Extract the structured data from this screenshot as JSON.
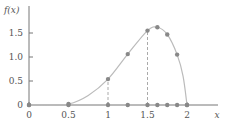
{
  "chart_data": {
    "type": "line",
    "title": "",
    "xlabel": "x",
    "ylabel": "f(x)",
    "xlim": [
      0,
      2.3
    ],
    "ylim": [
      0,
      1.75
    ],
    "x_ticks": [
      "0",
      "0.5",
      "1",
      "1.5",
      "2"
    ],
    "x_tick_values": [
      0,
      0.5,
      1,
      1.5,
      2
    ],
    "y_ticks": [
      "0",
      "0.5",
      "1.0",
      "1.5"
    ],
    "y_tick_values": [
      0,
      0.5,
      1.0,
      1.5
    ],
    "grid": false,
    "legend": null,
    "curve": {
      "x": [
        0,
        0.25,
        0.5,
        0.75,
        1.0,
        1.25,
        1.5,
        1.625,
        1.75,
        1.875,
        1.95,
        2.0
      ],
      "y": [
        0,
        0,
        0.02,
        0.2,
        0.54,
        1.06,
        1.55,
        1.62,
        1.47,
        1.05,
        0.6,
        0
      ]
    },
    "points_on_curve": {
      "x": [
        0,
        0.5,
        1.0,
        1.25,
        1.5,
        1.625,
        1.75,
        1.875,
        2.0
      ],
      "y": [
        0,
        0.02,
        0.54,
        1.06,
        1.55,
        1.62,
        1.47,
        1.05,
        0
      ]
    },
    "points_on_axis": {
      "x": [
        0,
        0.5,
        1.0,
        1.25,
        1.5,
        1.625,
        1.75,
        1.875,
        2.0
      ],
      "y": [
        0,
        0,
        0,
        0,
        0,
        0,
        0,
        0,
        0
      ]
    },
    "dashed_verticals": [
      1.0,
      1.5
    ],
    "colors": {
      "axis": "#777777",
      "curve": "#bbbbbb",
      "point": "#888888",
      "dash": "#aaaaaa"
    }
  }
}
